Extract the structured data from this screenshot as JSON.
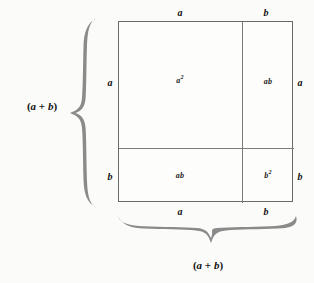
{
  "figure": {
    "accent_color": "#808080",
    "line_color": "#6a6a6a",
    "background_color": "#fbfbfa"
  },
  "square": {
    "cells": [
      {
        "name": "top-left",
        "label": "a",
        "exponent": "2"
      },
      {
        "name": "top-right",
        "label": "ab",
        "exponent": ""
      },
      {
        "name": "bottom-left",
        "label": "ab",
        "exponent": ""
      },
      {
        "name": "bottom-right",
        "label": "b",
        "exponent": "2"
      }
    ]
  },
  "edge_labels": {
    "top_left": "a",
    "top_right": "b",
    "bottom_left": "a",
    "bottom_right": "b",
    "left_top": "a",
    "left_bottom": "b",
    "right_top": "a",
    "right_bottom": "b"
  },
  "braces": {
    "left": {
      "icon": "curly-brace-left-icon",
      "caption_open": "(",
      "caption_a": "a",
      "caption_plus": " + ",
      "caption_b": "b",
      "caption_close": ")"
    },
    "bottom": {
      "icon": "curly-brace-down-icon",
      "caption_open": "(",
      "caption_a": "a",
      "caption_plus": " + ",
      "caption_b": "b",
      "caption_close": ")"
    }
  }
}
